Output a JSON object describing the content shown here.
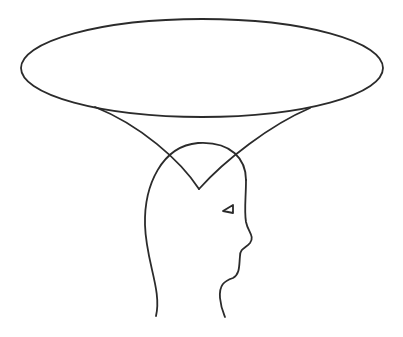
{
  "figure": {
    "background_color": "#ffffff",
    "stroke_color": "#2b2b2b",
    "stroke_width": 1.8,
    "elements": {
      "ellipse": {
        "cx": 202,
        "cy": 68,
        "rx": 181,
        "ry": 49
      },
      "funnel_left": "M 95 107 C 140 125, 180 160, 199 189",
      "funnel_right": "M 310 108 C 270 125, 225 160, 199 189",
      "head_left": "M 156 316 C 162 290, 146 262, 145 225 C 144 185, 162 146, 198 143 C 232 141, 246 160, 246 180",
      "head_right": "M 246 180 C 246 198, 244 210, 246 222 C 248 232, 255 236, 250 243 C 246 248, 240 248, 240 256 C 239 266, 240 274, 233 278 C 224 281, 219 285, 220 298 C 221 308, 223 312, 225 317",
      "eye": "M 233 205 L 223 211 L 233 213 Z"
    }
  }
}
